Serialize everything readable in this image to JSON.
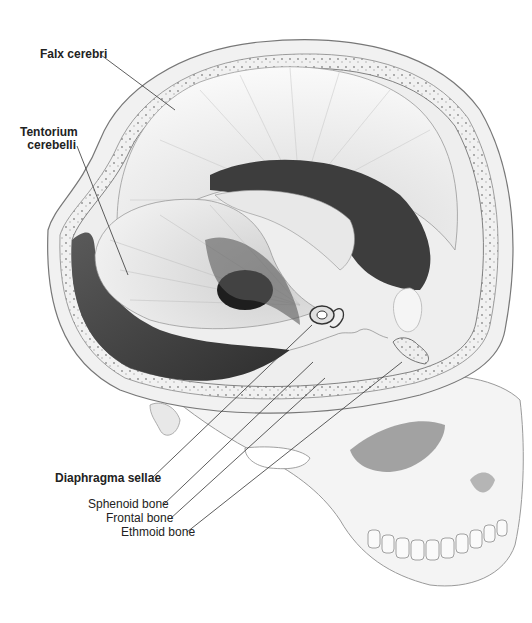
{
  "figure": {
    "labels": {
      "falx_cerebri": "Falx cerebri",
      "tentorium_line1": "Tentorium",
      "tentorium_line2": "cerebelli",
      "diaphragma_sellae": "Diaphragma sellae",
      "sphenoid_bone": "Sphenoid bone",
      "frontal_bone": "Frontal bone",
      "ethmoid_bone": "Ethmoid bone"
    },
    "colors": {
      "background": "#ffffff",
      "bone": "#f2f2f2",
      "bone_edge": "#8a8a8a",
      "dura_light": "#e6e6e6",
      "dura_dark": "#3a3a3a",
      "leader": "#333333",
      "text": "#222222"
    }
  }
}
